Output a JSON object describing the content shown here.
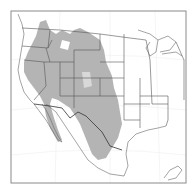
{
  "map": {
    "title": "",
    "region": "Western North America",
    "colors": {
      "background": "#ffffff",
      "frame": "#8a8a8a",
      "range_fill": "#b4b4b4",
      "range_light": "#d8d8d8",
      "boundary": "#555555",
      "coast": "#666666",
      "graticule": "#eeeeee"
    },
    "frame": {
      "x": 11,
      "y": 11,
      "width": 175,
      "height": 172
    },
    "legend": []
  }
}
